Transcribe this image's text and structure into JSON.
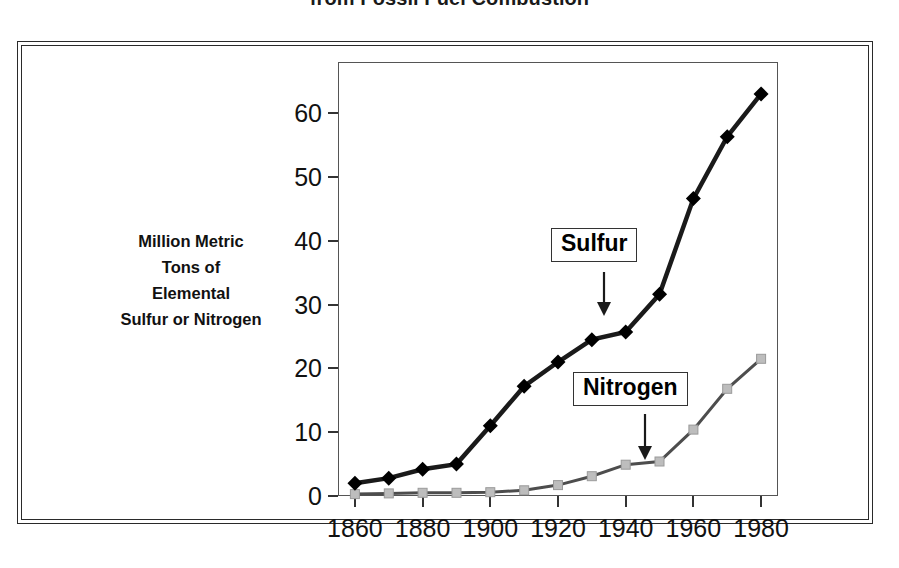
{
  "title": "from Fossil Fuel Combustion",
  "y_axis_title_lines": [
    "Million Metric",
    "Tons of",
    "Elemental",
    "Sulfur or Nitrogen"
  ],
  "callouts": {
    "sulfur": "Sulfur",
    "nitrogen": "Nitrogen"
  },
  "colors": {
    "sulfur_line": "#1a1a1a",
    "sulfur_marker": "#000000",
    "nitrogen_line": "#4d4d4d",
    "nitrogen_marker": "#bdbdbd",
    "frame": "#2a2a2a",
    "axis": "#555555",
    "text": "#111111",
    "background": "#ffffff"
  },
  "chart_data": {
    "type": "line",
    "title": "from Fossil Fuel Combustion",
    "xlabel": "",
    "ylabel": "Million Metric Tons of Elemental Sulfur or Nitrogen",
    "x": [
      1860,
      1870,
      1880,
      1890,
      1900,
      1910,
      1920,
      1930,
      1940,
      1950,
      1960,
      1970,
      1980
    ],
    "xlim": [
      1855,
      1985
    ],
    "ylim": [
      0,
      68
    ],
    "xticks": [
      1860,
      1880,
      1900,
      1920,
      1940,
      1960,
      1980
    ],
    "yticks": [
      0,
      10,
      20,
      30,
      40,
      50,
      60
    ],
    "xtick_labels": [
      "1860",
      "1880",
      "1900",
      "1920",
      "1940",
      "1960",
      "1980"
    ],
    "ytick_labels": [
      "0",
      "10",
      "20",
      "30",
      "40",
      "50",
      "60"
    ],
    "grid": false,
    "legend": "annotated-callouts",
    "series": [
      {
        "name": "Sulfur",
        "marker": "diamond",
        "color": "#1a1a1a",
        "values": [
          2.0,
          2.8,
          4.2,
          5.0,
          11.0,
          17.2,
          21.0,
          24.5,
          25.7,
          31.6,
          46.6,
          56.3,
          63.0
        ]
      },
      {
        "name": "Nitrogen",
        "marker": "square",
        "color": "#bdbdbd",
        "values": [
          0.3,
          0.4,
          0.5,
          0.5,
          0.6,
          0.9,
          1.7,
          3.1,
          4.9,
          5.4,
          10.4,
          16.8,
          21.5
        ]
      }
    ],
    "annotations": [
      {
        "text": "Sulfur",
        "points_to_x": 1935,
        "points_to_y": 25.5
      },
      {
        "text": "Nitrogen",
        "points_to_x": 1945,
        "points_to_y": 5.5
      }
    ]
  }
}
